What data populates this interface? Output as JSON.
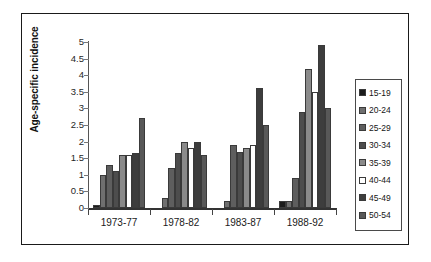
{
  "chart_data": {
    "type": "bar",
    "title": "",
    "subtitle": "",
    "xlabel": "",
    "ylabel": "Age-specific incidence",
    "categories": [
      "1973-77",
      "1978-82",
      "1983-87",
      "1988-92"
    ],
    "ylim": [
      0,
      5
    ],
    "ytick_labels": [
      "0",
      "0.5",
      "1",
      "1.5",
      "2",
      "2.5",
      "3",
      "3.5",
      "4",
      "4.5",
      "5"
    ],
    "ytick_values": [
      0,
      0.5,
      1,
      1.5,
      2,
      2.5,
      3,
      3.5,
      4,
      4.5,
      5
    ],
    "grid": false,
    "legend_position": "right",
    "series": [
      {
        "name": "15-19",
        "color": "#1b1b1b",
        "values": [
          0.1,
          0.0,
          0.0,
          0.2
        ]
      },
      {
        "name": "20-24",
        "color": "#6f6f6f",
        "values": [
          1.0,
          0.3,
          0.2,
          0.2
        ]
      },
      {
        "name": "25-29",
        "color": "#5e5e5e",
        "values": [
          1.3,
          1.2,
          1.9,
          0.9
        ]
      },
      {
        "name": "30-34",
        "color": "#4d4d4d",
        "values": [
          1.1,
          1.65,
          1.7,
          2.9
        ]
      },
      {
        "name": "35-39",
        "color": "#8a8a8a",
        "values": [
          1.6,
          2.0,
          1.8,
          4.2
        ]
      },
      {
        "name": "40-44",
        "color": "#ffffff",
        "values": [
          1.6,
          1.8,
          1.9,
          3.5
        ]
      },
      {
        "name": "45-49",
        "color": "#3d3d3d",
        "values": [
          1.65,
          2.0,
          3.6,
          4.9
        ]
      },
      {
        "name": "50-54",
        "color": "#585858",
        "values": [
          2.7,
          1.6,
          2.5,
          3.0
        ]
      }
    ]
  },
  "legend": {
    "items": [
      {
        "label": "15-19"
      },
      {
        "label": "20-24"
      },
      {
        "label": "25-29"
      },
      {
        "label": "30-34"
      },
      {
        "label": "35-39"
      },
      {
        "label": "40-44"
      },
      {
        "label": "45-49"
      },
      {
        "label": "50-54"
      }
    ]
  }
}
